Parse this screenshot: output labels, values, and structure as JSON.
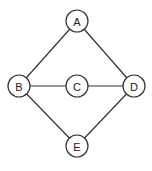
{
  "graph": {
    "nodes": [
      {
        "id": "A",
        "label": "A",
        "x": 77,
        "y": 21
      },
      {
        "id": "B",
        "label": "B",
        "x": 19,
        "y": 86
      },
      {
        "id": "C",
        "label": "C",
        "x": 77,
        "y": 86
      },
      {
        "id": "D",
        "label": "D",
        "x": 134,
        "y": 86
      },
      {
        "id": "E",
        "label": "E",
        "x": 77,
        "y": 146
      }
    ],
    "edges": [
      {
        "from": "A",
        "to": "B"
      },
      {
        "from": "A",
        "to": "D"
      },
      {
        "from": "B",
        "to": "C"
      },
      {
        "from": "C",
        "to": "D"
      },
      {
        "from": "B",
        "to": "E"
      },
      {
        "from": "D",
        "to": "E"
      }
    ],
    "node_radius": 11,
    "stroke_color": "#333333",
    "fill_color": "#ffffff"
  }
}
